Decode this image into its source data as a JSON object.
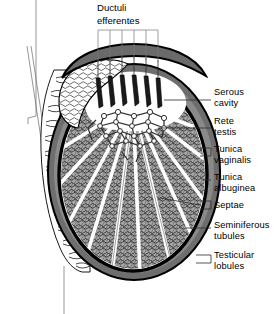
{
  "figure": {
    "type": "anatomical-diagram",
    "background_color": "#ffffff",
    "top_label": {
      "line1": "Ductuli",
      "line2": "efferentes",
      "bracket_line_count": 6
    },
    "labels": [
      {
        "id": "serous-cavity",
        "line1": "Serous",
        "line2": "cavity",
        "connector": "line"
      },
      {
        "id": "rete-testis",
        "line1": "Rete",
        "line2": "testis",
        "connector": "line"
      },
      {
        "id": "tunica-vaginalis",
        "line1": "Tunica",
        "line2": "vaginalis",
        "connector": "bracket"
      },
      {
        "id": "tunica-albuginea",
        "line1": "Tunica",
        "line2": "albuginea",
        "connector": "line"
      },
      {
        "id": "septae",
        "line1": "Septae",
        "line2": "",
        "connector": "bracket"
      },
      {
        "id": "seminiferous-tubules",
        "line1": "Seminiferous",
        "line2": "tubules",
        "connector": "line"
      },
      {
        "id": "testicular-lobules",
        "line1": "Testicular",
        "line2": "lobules",
        "connector": "bracket"
      }
    ],
    "colors": {
      "outline": "#000000",
      "serous_cavity": "#8a8a8a",
      "tunica_vaginalis": "#6e6e6e",
      "tunica_albuginea": "#000000",
      "lobule_fill": "#9e9e9e",
      "septae": "#ffffff",
      "epididymis": "#ffffff",
      "ductuli": "#1a1a1a",
      "leader": "#555555",
      "text": "#000000"
    }
  }
}
